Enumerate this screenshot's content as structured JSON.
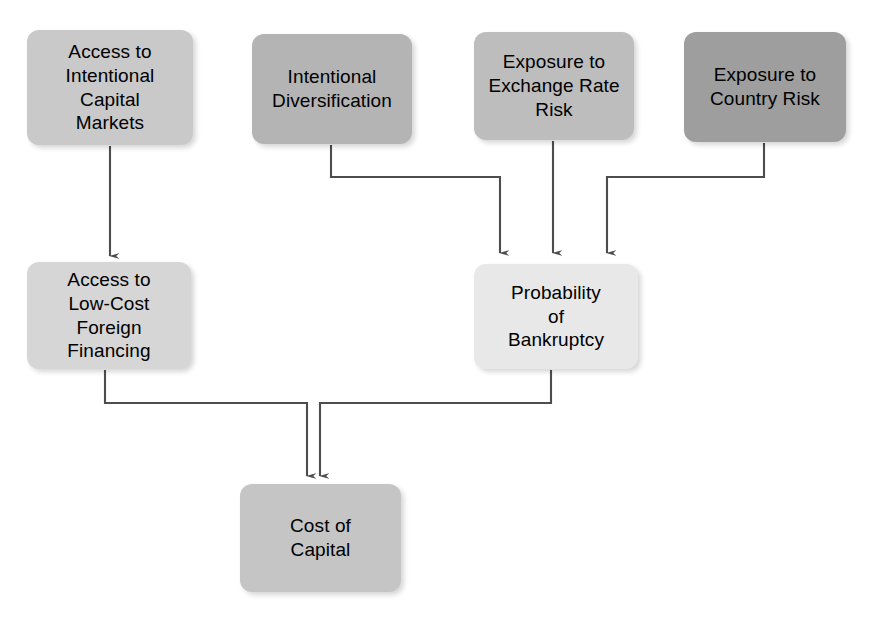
{
  "diagram": {
    "background_color": "#ffffff",
    "connector_color": "#4d4d4d",
    "text_color": "#000000",
    "nodes": [
      {
        "id": "access-international-capital-markets",
        "label": "Access to\nIntentional\nCapital\nMarkets",
        "fill": "#c9c9c9",
        "x": 27,
        "y": 30,
        "w": 166,
        "h": 115
      },
      {
        "id": "intentional-diversification",
        "label": "Intentional\nDiversification",
        "fill": "#b4b4b4",
        "x": 252,
        "y": 34,
        "w": 160,
        "h": 110
      },
      {
        "id": "exposure-exchange-rate-risk",
        "label": "Exposure to\nExchange Rate\nRisk",
        "fill": "#bdbdbd",
        "x": 474,
        "y": 32,
        "w": 160,
        "h": 108
      },
      {
        "id": "exposure-country-risk",
        "label": "Exposure to\nCountry Risk",
        "fill": "#9e9e9e",
        "x": 684,
        "y": 32,
        "w": 162,
        "h": 110
      },
      {
        "id": "access-low-cost-foreign-financing",
        "label": "Access to\nLow-Cost\nForeign\nFinancing",
        "fill": "#d6d6d6",
        "x": 27,
        "y": 262,
        "w": 164,
        "h": 107
      },
      {
        "id": "probability-of-bankruptcy",
        "label": "Probability\nof\nBankruptcy",
        "fill": "#e8e8e8",
        "x": 474,
        "y": 264,
        "w": 164,
        "h": 105
      },
      {
        "id": "cost-of-capital",
        "label": "Cost of\nCapital",
        "fill": "#c5c5c5",
        "x": 240,
        "y": 484,
        "w": 161,
        "h": 108
      }
    ],
    "edges": [
      {
        "id": "edge-capital-markets-to-financing",
        "from": "access-international-capital-markets",
        "to": "access-low-cost-foreign-financing",
        "path": "M 110,146 L 110,256",
        "arrow_at": "110,261"
      },
      {
        "id": "edge-diversification-to-bankruptcy",
        "from": "intentional-diversification",
        "to": "probability-of-bankruptcy",
        "path": "M 331,145 L 331,177 L 500,177 L 500,253",
        "arrow_at": "500,260"
      },
      {
        "id": "edge-exchange-rate-to-bankruptcy",
        "from": "exposure-exchange-rate-risk",
        "to": "probability-of-bankruptcy",
        "path": "M 553,141 L 553,253",
        "arrow_at": "553,260"
      },
      {
        "id": "edge-country-risk-to-bankruptcy",
        "from": "exposure-country-risk",
        "to": "probability-of-bankruptcy",
        "path": "M 764,143 L 764,177 L 607,177 L 607,253",
        "arrow_at": "607,260"
      },
      {
        "id": "edge-financing-to-cost-of-capital",
        "from": "access-low-cost-foreign-financing",
        "to": "cost-of-capital",
        "path": "M 105,370 L 105,403 L 307,403 L 307,476",
        "arrow_at": "307,482"
      },
      {
        "id": "edge-bankruptcy-to-cost-of-capital",
        "from": "probability-of-bankruptcy",
        "to": "cost-of-capital",
        "path": "M 551,370 L 551,403 L 320,403 L 320,476",
        "arrow_at": "320,482"
      }
    ]
  }
}
